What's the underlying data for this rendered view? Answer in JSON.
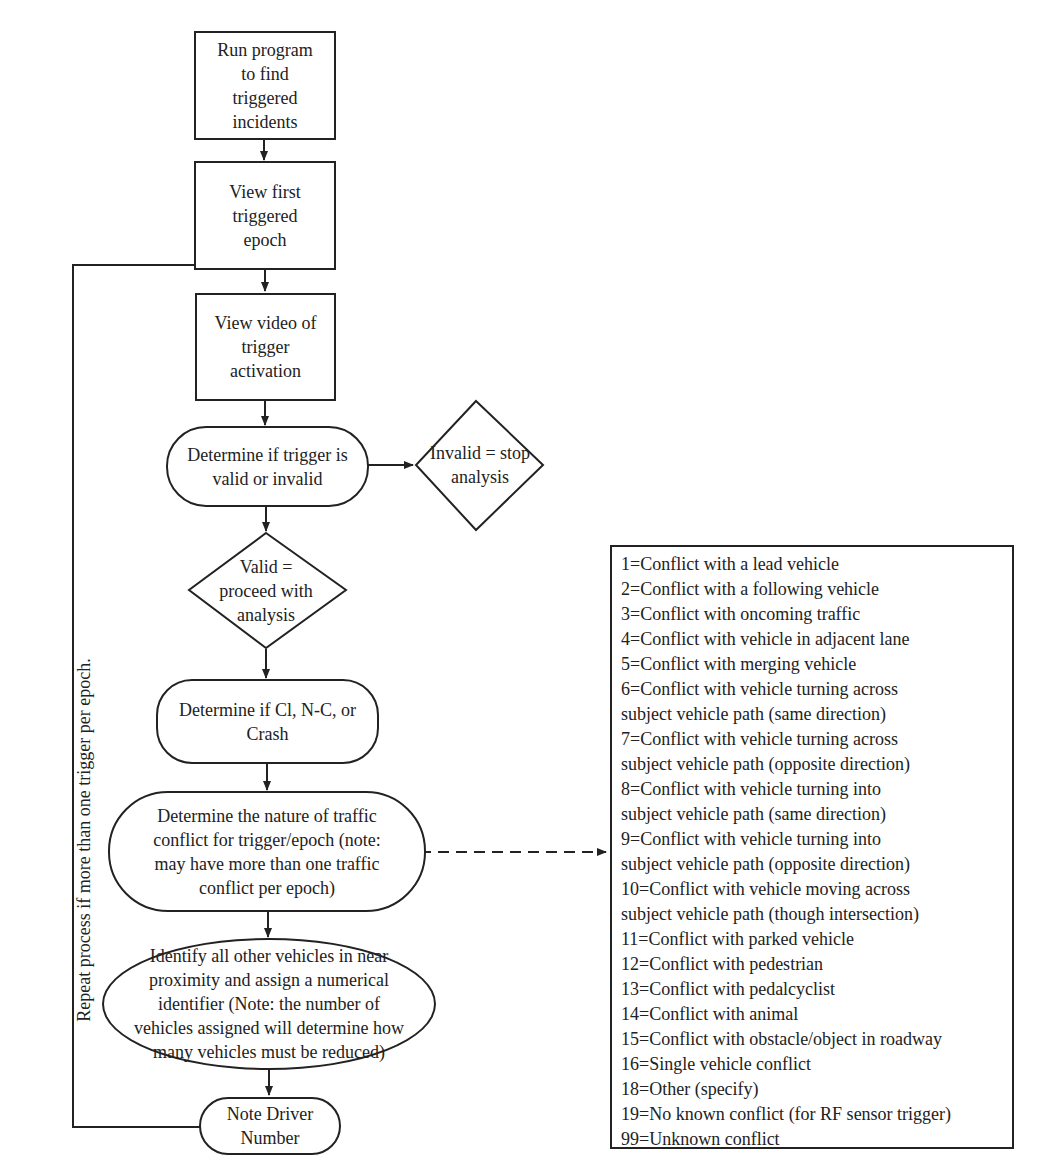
{
  "diagram": {
    "type": "flowchart",
    "nodes": {
      "run_program": {
        "shape": "rectangle",
        "text": "Run program\nto find\ntriggered\nincidents"
      },
      "view_first_epoch": {
        "shape": "rectangle",
        "text": "View first\ntriggered\nepoch"
      },
      "view_video": {
        "shape": "rectangle",
        "text": "View video of\ntrigger\nactivation"
      },
      "determine_valid": {
        "shape": "rounded",
        "text": "Determine if trigger is\nvalid or invalid"
      },
      "invalid_stop": {
        "shape": "diamond",
        "text": "Invalid = stop\nanalysis"
      },
      "valid_proceed": {
        "shape": "diamond",
        "text": "Valid =\nproceed with\nanalysis"
      },
      "determine_ci": {
        "shape": "rounded",
        "text": "Determine if Cl, N-C, or\nCrash"
      },
      "determine_nature": {
        "shape": "rounded",
        "text": "Determine the nature of traffic\nconflict for trigger/epoch (note:\nmay have more than one traffic\nconflict per epoch)"
      },
      "identify_vehicles": {
        "shape": "rounded",
        "text": "Identify all other vehicles in near\nproximity and assign a numerical\nidentifier (Note: the number of\nvehicles assigned will determine how\nmany vehicles must be reduced)"
      },
      "note_driver": {
        "shape": "rounded",
        "text": "Note Driver\nNumber"
      }
    },
    "edges": [
      {
        "from": "run_program",
        "to": "view_first_epoch",
        "style": "solid"
      },
      {
        "from": "view_first_epoch",
        "to": "view_video",
        "style": "solid"
      },
      {
        "from": "view_video",
        "to": "determine_valid",
        "style": "solid"
      },
      {
        "from": "determine_valid",
        "to": "invalid_stop",
        "style": "solid"
      },
      {
        "from": "determine_valid",
        "to": "valid_proceed",
        "style": "solid"
      },
      {
        "from": "valid_proceed",
        "to": "determine_ci",
        "style": "solid"
      },
      {
        "from": "determine_ci",
        "to": "determine_nature",
        "style": "solid"
      },
      {
        "from": "determine_nature",
        "to": "conflict_codes",
        "style": "dashed"
      },
      {
        "from": "determine_nature",
        "to": "identify_vehicles",
        "style": "solid"
      },
      {
        "from": "identify_vehicles",
        "to": "note_driver",
        "style": "solid"
      },
      {
        "from": "note_driver",
        "to": "view_video",
        "style": "solid",
        "label": "loop"
      }
    ],
    "loop_label": "Repeat process if more than\none trigger per epoch.",
    "conflict_codes": [
      "1=Conflict with a lead vehicle",
      "2=Conflict with a following vehicle",
      "3=Conflict with oncoming traffic",
      "4=Conflict with vehicle in adjacent lane",
      "5=Conflict with merging vehicle",
      "6=Conflict with vehicle turning across",
      "subject vehicle path (same direction)",
      "7=Conflict with vehicle turning across",
      "subject vehicle path (opposite direction)",
      "8=Conflict with vehicle turning into",
      "subject vehicle path (same direction)",
      "9=Conflict with vehicle turning into",
      "subject vehicle path (opposite direction)",
      "10=Conflict with vehicle moving across",
      "subject vehicle path (though intersection)",
      "11=Conflict with parked vehicle",
      "12=Conflict with pedestrian",
      "13=Conflict with pedalcyclist",
      "14=Conflict with animal",
      "15=Conflict with obstacle/object in roadway",
      "16=Single vehicle conflict",
      "18=Other (specify)",
      "19=No known conflict (for RF sensor trigger)",
      "99=Unknown conflict"
    ]
  }
}
